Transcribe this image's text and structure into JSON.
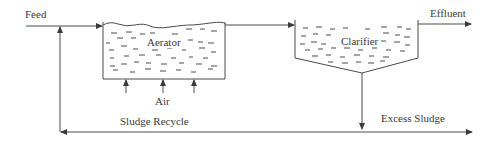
{
  "diagram": {
    "labels": {
      "feed": "Feed",
      "effluent": "Effluent",
      "aerator": "Aerator",
      "clarifier": "Clarifier",
      "air": "Air",
      "sludge_recycle": "Sludge Recycle",
      "excess_sludge": "Excess Sludge"
    },
    "colors": {
      "line": "#4a4a4a",
      "text": "#3a3a3a",
      "background": "#ffffff"
    },
    "nodes": [
      "Aerator",
      "Clarifier"
    ],
    "flows": [
      {
        "from": "Feed",
        "to": "Aerator"
      },
      {
        "from": "Aerator",
        "to": "Clarifier"
      },
      {
        "from": "Clarifier",
        "to": "Effluent"
      },
      {
        "from": "Clarifier",
        "to": "Excess Sludge"
      },
      {
        "from": "Clarifier",
        "to": "Aerator",
        "label": "Sludge Recycle"
      },
      {
        "from": "Air",
        "to": "Aerator"
      }
    ]
  }
}
